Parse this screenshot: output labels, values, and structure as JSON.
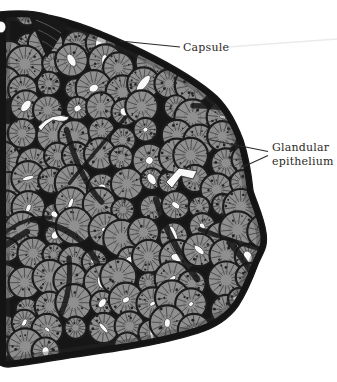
{
  "figure": {
    "type": "histology-illustration",
    "labels": {
      "capsule": "Capsule",
      "glandular_line1": "Glandular",
      "glandular_line2": "epithelium"
    },
    "palette": {
      "background": "#ffffff",
      "capsule_septa": "#161616",
      "acinus_fill": "#8f8f8f",
      "acinus_texture": "#4a4a4a",
      "acinus_dot": "#232323",
      "lumen": "#f8f8f8",
      "label_text": "#2d2a26",
      "artifact_line": "#ebebeb"
    }
  }
}
